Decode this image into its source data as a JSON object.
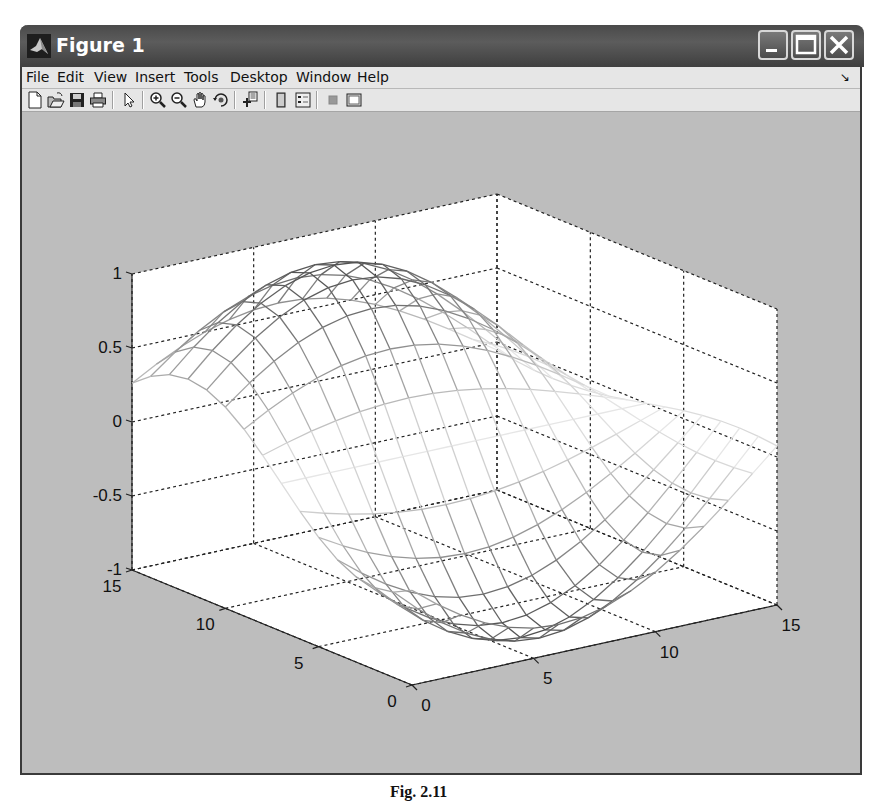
{
  "window": {
    "title": "Figure 1",
    "controls": [
      "minimize",
      "maximize",
      "close"
    ]
  },
  "menubar": {
    "items": [
      "File",
      "Edit",
      "View",
      "Insert",
      "Tools",
      "Desktop",
      "Window",
      "Help"
    ],
    "dock_arrow": "↘"
  },
  "toolbar": {
    "buttons": [
      {
        "name": "new-figure",
        "icon": "new-file-icon"
      },
      {
        "name": "open-file",
        "icon": "folder-open-icon"
      },
      {
        "name": "save-figure",
        "icon": "save-icon"
      },
      {
        "name": "print-figure",
        "icon": "print-icon"
      },
      {
        "name": "edit-plot",
        "icon": "pointer-arrow-icon"
      },
      {
        "name": "zoom-in",
        "icon": "zoom-in-icon"
      },
      {
        "name": "zoom-out",
        "icon": "zoom-out-icon"
      },
      {
        "name": "pan",
        "icon": "hand-icon"
      },
      {
        "name": "rotate-3d",
        "icon": "rotate-3d-icon"
      },
      {
        "name": "data-cursor",
        "icon": "data-cursor-icon"
      },
      {
        "name": "insert-colorbar",
        "icon": "colorbar-icon"
      },
      {
        "name": "insert-legend",
        "icon": "legend-icon"
      },
      {
        "name": "hide-plot-tools",
        "icon": "hide-plot-tools-icon"
      },
      {
        "name": "show-plot-tools",
        "icon": "show-plot-tools-icon"
      }
    ]
  },
  "colors": {
    "figure_bg": "#bdbdbd",
    "axes_bg": "#ffffff",
    "titlebar": "#4a4a4a",
    "menubar": "#e6e6e6"
  },
  "caption": "Fig. 2.11",
  "chart_data": {
    "type": "mesh3d",
    "title": "",
    "xlabel": "",
    "ylabel": "",
    "zlabel": "",
    "x_ticks": [
      0,
      5,
      10,
      15
    ],
    "y_ticks": [
      0,
      5,
      10,
      15
    ],
    "z_ticks": [
      -1,
      -0.5,
      0,
      0.5,
      1
    ],
    "z_tick_labels": [
      "-1",
      "-0.5",
      "0",
      "0.5",
      "1"
    ],
    "xlim": [
      0,
      15
    ],
    "ylim": [
      0,
      15
    ],
    "zlim": [
      -1,
      1
    ],
    "grid": true,
    "box": false,
    "grid_size": [
      16,
      16
    ],
    "surface_description": "wireframe mesh, gray colormap; peak z≈1 near (x≈7, y≈12), valley z≈-1 near (x≈7, y≈2)",
    "surface_formula": {
      "kind": "z = -cos(pi*(y-2)/10) * sin(pi*(x+a)/p)",
      "a": 2.5,
      "p": 17
    },
    "labels": {
      "z": [
        "1",
        "0.5",
        "0",
        "-0.5",
        "-1"
      ],
      "x": [
        "0",
        "5",
        "10",
        "15"
      ],
      "y": [
        "0",
        "5",
        "10",
        "15"
      ]
    }
  }
}
